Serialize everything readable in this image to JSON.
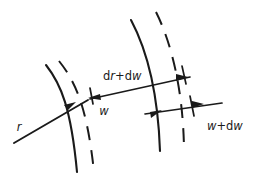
{
  "figure": {
    "background_color": "#ffffff",
    "ink_color": "#1a1a1a",
    "width": 253,
    "height": 179
  },
  "labels": {
    "radius": {
      "text": "r",
      "italic_parts": "r",
      "x": 19,
      "y": 128
    },
    "width": {
      "text": "w",
      "italic_parts": "w",
      "x": 104,
      "y": 112
    },
    "delta": {
      "text": "dr+dw",
      "plain_prefix": "d",
      "italic_1": "r",
      "plus": "+d",
      "italic_2": "w",
      "x": 103,
      "y": 79
    },
    "width_plus": {
      "text": "w+dw",
      "italic_1": "w",
      "plus": "+d",
      "italic_2": "w",
      "x": 207,
      "y": 127
    }
  },
  "elements": {
    "arc_inner_solid": {
      "name": "inner-wavefront-solid-arc",
      "style": "solid",
      "path": "M 46,65 C 62,86 72,110 78,172"
    },
    "arc_inner_dashed": {
      "name": "inner-wavefront-dashed-arc",
      "style": "dashed",
      "path": "M 58,61 C 76,82 88,108 94,172",
      "dash_pattern": "13 9"
    },
    "arc_outer_solid": {
      "name": "outer-wavefront-solid-arc",
      "style": "solid",
      "path": "M 131,20 C 147,49 158,93 160,151"
    },
    "arc_outer_dashed": {
      "name": "outer-wavefront-dashed-arc",
      "style": "dashed",
      "path": "M 156,12 C 172,43 182,90 184,148",
      "dash_pattern": "13 9"
    },
    "ray": {
      "name": "radius-ray",
      "from_x": 14,
      "from_y": 143,
      "to_x": 222,
      "to_y": 106
    },
    "arrow_ray": {
      "name": "ray-arrowhead",
      "tip_x": 76,
      "tip_y": 103,
      "direction": "up-right"
    },
    "arrow_w_left": {
      "name": "w-dimension-arrowhead",
      "tip_x": 88,
      "tip_y": 97,
      "direction": "left"
    },
    "arrow_dr_right": {
      "name": "dr-dw-dimension-arrowhead",
      "tip_x": 187,
      "tip_y": 77,
      "direction": "right"
    },
    "arrow_wdw_left": {
      "name": "w-dw-left-arrowhead",
      "tip_x": 159,
      "tip_y": 111,
      "direction": "right"
    },
    "arrow_wdw_right": {
      "name": "w-dw-right-arrowhead",
      "tip_x": 199,
      "tip_y": 104,
      "direction": "right"
    },
    "tick_w": {
      "name": "w-boundary-tick",
      "x": 91,
      "y": 88
    },
    "tick_dr": {
      "name": "dr-dw-boundary-tick",
      "x": 184,
      "y": 70
    },
    "tick_wdw": {
      "name": "w-dw-boundary-tick",
      "x": 192,
      "y": 101
    }
  }
}
